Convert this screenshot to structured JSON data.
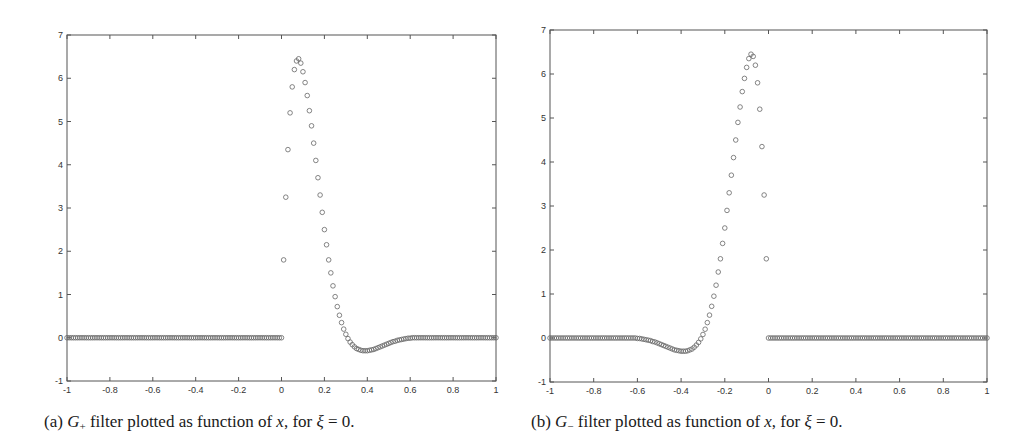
{
  "chart_data": [
    {
      "id": "a",
      "type": "scatter",
      "title": "",
      "caption": {
        "label": "(a)",
        "symbol": "G",
        "subscript": "+",
        "text_mid": "filter plotted as function of",
        "var": "x",
        "text_for": ", for",
        "greek": "ξ",
        "equals": "=",
        "value": "0."
      },
      "xlabel": "",
      "ylabel": "",
      "xlim": [
        -1,
        1
      ],
      "ylim": [
        -1,
        7
      ],
      "xticks": [
        -1,
        -0.8,
        -0.6,
        -0.4,
        -0.2,
        0,
        0.2,
        0.4,
        0.6,
        0.8,
        1
      ],
      "xtick_labels": [
        "-1",
        "-0.8",
        "-0.6",
        "-0.4",
        "-0.2",
        "0",
        "0.2",
        "0.4",
        "0.6",
        "0.8",
        "1"
      ],
      "yticks": [
        -1,
        0,
        1,
        2,
        3,
        4,
        5,
        6,
        7
      ],
      "ytick_labels": [
        "-1",
        "0",
        "1",
        "2",
        "3",
        "4",
        "5",
        "6",
        "7"
      ],
      "grid": false,
      "legend": null,
      "marker": "open-circle",
      "marker_color": "#666666",
      "mirror": false,
      "x_step": 0.01,
      "x_start": -1,
      "series": [
        {
          "name": "G+",
          "positive_side_values": [
            0,
            1.8,
            3.25,
            4.35,
            5.2,
            5.8,
            6.2,
            6.4,
            6.45,
            6.35,
            6.15,
            5.9,
            5.6,
            5.25,
            4.9,
            4.5,
            4.1,
            3.7,
            3.3,
            2.9,
            2.5,
            2.15,
            1.8,
            1.5,
            1.2,
            0.95,
            0.72,
            0.52,
            0.35,
            0.2,
            0.08,
            -0.02,
            -0.1,
            -0.16,
            -0.21,
            -0.25,
            -0.27,
            -0.29,
            -0.3,
            -0.3,
            -0.3,
            -0.29,
            -0.28,
            -0.27,
            -0.25,
            -0.23,
            -0.21,
            -0.19,
            -0.17,
            -0.15,
            -0.13,
            -0.11,
            -0.09,
            -0.08,
            -0.06,
            -0.05,
            -0.04,
            -0.03,
            -0.02,
            -0.01,
            -0.01,
            0,
            0,
            0,
            0,
            0,
            0,
            0,
            0,
            0,
            0,
            0,
            0,
            0,
            0,
            0,
            0,
            0,
            0,
            0,
            0,
            0,
            0,
            0,
            0,
            0,
            0,
            0,
            0,
            0,
            0,
            0,
            0,
            0,
            0,
            0,
            0,
            0,
            0,
            0,
            0
          ],
          "negative_side_value": 0,
          "peak": {
            "x": 0.08,
            "y": 6.45
          },
          "minimum": {
            "x": 0.39,
            "y": -0.3
          }
        }
      ]
    },
    {
      "id": "b",
      "type": "scatter",
      "title": "",
      "caption": {
        "label": "(b)",
        "symbol": "G",
        "subscript": "−",
        "text_mid": "filter plotted as function of",
        "var": "x",
        "text_for": ", for",
        "greek": "ξ",
        "equals": "=",
        "value": "0."
      },
      "xlabel": "",
      "ylabel": "",
      "xlim": [
        -1,
        1
      ],
      "ylim": [
        -1,
        7
      ],
      "xticks": [
        -1,
        -0.8,
        -0.6,
        -0.4,
        -0.2,
        0,
        0.2,
        0.4,
        0.6,
        0.8,
        1
      ],
      "xtick_labels": [
        "-1",
        "-0.8",
        "-0.6",
        "-0.4",
        "-0.2",
        "0",
        "0.2",
        "0.4",
        "0.6",
        "0.8",
        "1"
      ],
      "yticks": [
        -1,
        0,
        1,
        2,
        3,
        4,
        5,
        6,
        7
      ],
      "ytick_labels": [
        "-1",
        "0",
        "1",
        "2",
        "3",
        "4",
        "5",
        "6",
        "7"
      ],
      "grid": false,
      "legend": null,
      "marker": "open-circle",
      "marker_color": "#666666",
      "mirror": true,
      "x_step": 0.01,
      "x_start": -1,
      "series": [
        {
          "name": "G−",
          "note": "mirror image of G+ : G−(x) = G+(−x)",
          "peak": {
            "x": -0.08,
            "y": 6.45
          },
          "minimum": {
            "x": -0.39,
            "y": -0.3
          }
        }
      ]
    }
  ]
}
